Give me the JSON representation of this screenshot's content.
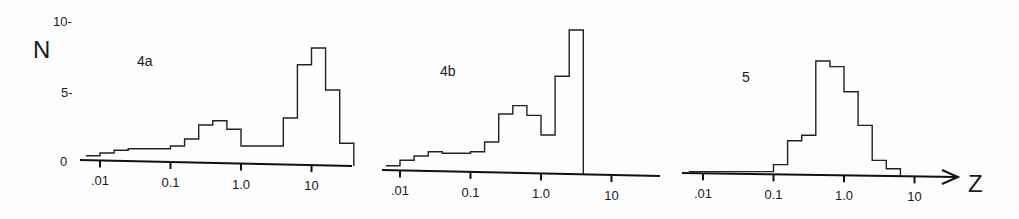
{
  "chart_data": [
    {
      "type": "bar",
      "panel_label": "4a",
      "xscale": "log",
      "xlabel": "",
      "ylabel": "N",
      "x_ticks": [
        ".01",
        "0.1",
        "1.0",
        "10"
      ],
      "y_ticks": [
        "0",
        "5",
        "10"
      ],
      "ylim": [
        0,
        10
      ],
      "bin_edges_log10": [
        -2.2,
        -2.0,
        -1.8,
        -1.6,
        -1.4,
        -1.2,
        -1.0,
        -0.8,
        -0.6,
        -0.4,
        -0.2,
        0.0,
        0.2,
        0.4,
        0.6,
        0.8,
        1.0,
        1.2,
        1.4,
        1.6
      ],
      "values": [
        0.3,
        0.5,
        0.7,
        0.8,
        0.8,
        0.8,
        1.0,
        1.5,
        2.5,
        2.8,
        2.2,
        1.0,
        1.0,
        1.0,
        3.0,
        6.8,
        8.0,
        5.0,
        1.2
      ]
    },
    {
      "type": "bar",
      "panel_label": "4b",
      "xscale": "log",
      "xlabel": "",
      "ylabel": "N",
      "x_ticks": [
        ".01",
        "0.1",
        "1.0",
        "10"
      ],
      "ylim": [
        0,
        10
      ],
      "bin_edges_log10": [
        -2.2,
        -2.0,
        -1.8,
        -1.6,
        -1.4,
        -1.2,
        -1.0,
        -0.8,
        -0.6,
        -0.4,
        -0.2,
        0.0,
        0.2,
        0.4,
        0.6
      ],
      "values": [
        0.3,
        0.7,
        1.0,
        1.3,
        1.2,
        1.2,
        1.3,
        2.0,
        4.0,
        4.6,
        3.9,
        2.5,
        6.7,
        10.0
      ]
    },
    {
      "type": "bar",
      "panel_label": "5",
      "xscale": "log",
      "xlabel": "Z",
      "ylabel": "N",
      "x_ticks": [
        ".01",
        "0.1",
        "1.0",
        "10"
      ],
      "ylim": [
        0,
        10
      ],
      "bin_edges_log10": [
        -2.2,
        -1.0,
        -0.8,
        -0.6,
        -0.4,
        -0.2,
        0.0,
        0.2,
        0.4,
        0.6,
        0.8,
        1.0
      ],
      "values": [
        0.1,
        0.6,
        2.3,
        2.7,
        8.0,
        7.6,
        5.8,
        3.4,
        0.9,
        0.3
      ]
    }
  ],
  "labels": {
    "y_axis": "N",
    "x_axis": "Z",
    "y_tick_10": "10-",
    "y_tick_5": "5-",
    "y_tick_0": "0",
    "panels": [
      "4a",
      "4b",
      "5"
    ],
    "x_ticks": [
      ".01",
      "0.1",
      "1.0",
      "10"
    ]
  }
}
